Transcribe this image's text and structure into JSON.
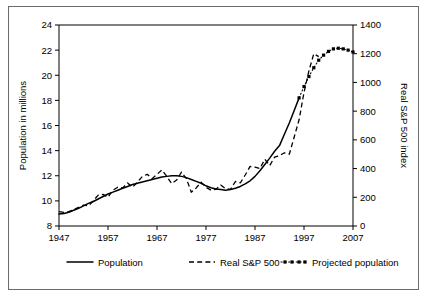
{
  "chart_data": {
    "type": "line",
    "title": "",
    "xlabel": "",
    "ylabel": "Population in millions",
    "y2label": "Real S&P 500 index",
    "xlim": [
      1947,
      2007
    ],
    "ylim": [
      8,
      24
    ],
    "y2lim": [
      0,
      1400
    ],
    "xticks": [
      1947,
      1957,
      1967,
      1977,
      1987,
      1997,
      2007
    ],
    "yticks": [
      8,
      10,
      12,
      14,
      16,
      18,
      20,
      22,
      24
    ],
    "y2ticks": [
      0,
      200,
      400,
      600,
      800,
      1000,
      1200,
      1400
    ],
    "grid": false,
    "legend_position": "bottom",
    "series": [
      {
        "name": "Population",
        "axis": "left",
        "style": "solid",
        "marker": "none",
        "x": [
          1947,
          1948,
          1949,
          1950,
          1951,
          1952,
          1953,
          1954,
          1955,
          1956,
          1957,
          1958,
          1959,
          1960,
          1961,
          1962,
          1963,
          1964,
          1965,
          1966,
          1967,
          1968,
          1969,
          1970,
          1971,
          1972,
          1973,
          1974,
          1975,
          1976,
          1977,
          1978,
          1979,
          1980,
          1981,
          1982,
          1983,
          1984,
          1985,
          1986,
          1987,
          1988,
          1989,
          1990,
          1991,
          1992,
          1993,
          1994,
          1995,
          1996
        ],
        "y": [
          8.95,
          9.0,
          9.1,
          9.25,
          9.4,
          9.6,
          9.8,
          9.95,
          10.15,
          10.35,
          10.55,
          10.7,
          10.85,
          11.0,
          11.15,
          11.3,
          11.4,
          11.5,
          11.6,
          11.7,
          11.8,
          11.9,
          11.95,
          12.0,
          12.0,
          11.95,
          11.85,
          11.7,
          11.55,
          11.4,
          11.2,
          11.05,
          10.95,
          10.9,
          10.85,
          10.9,
          11.0,
          11.15,
          11.35,
          11.6,
          11.95,
          12.4,
          12.9,
          13.4,
          13.95,
          14.4,
          15.3,
          16.2,
          17.2,
          18.2
        ]
      },
      {
        "name": "Real S&P 500",
        "axis": "right",
        "style": "dashed",
        "marker": "none",
        "x": [
          1947,
          1948,
          1949,
          1950,
          1951,
          1952,
          1953,
          1954,
          1955,
          1956,
          1957,
          1958,
          1959,
          1960,
          1961,
          1962,
          1963,
          1964,
          1965,
          1966,
          1967,
          1968,
          1969,
          1970,
          1971,
          1972,
          1973,
          1974,
          1975,
          1976,
          1977,
          1978,
          1979,
          1980,
          1981,
          1982,
          1983,
          1984,
          1985,
          1986,
          1987,
          1988,
          1989,
          1990,
          1991,
          1992,
          1993,
          1994,
          1995,
          1996,
          1997,
          1998,
          1999,
          2000
        ],
        "y": [
          100,
          95,
          100,
          115,
          130,
          145,
          140,
          175,
          215,
          220,
          200,
          250,
          270,
          265,
          300,
          270,
          305,
          345,
          360,
          330,
          360,
          390,
          345,
          295,
          320,
          375,
          330,
          235,
          265,
          305,
          270,
          250,
          255,
          285,
          260,
          255,
          310,
          300,
          355,
          415,
          410,
          400,
          465,
          420,
          480,
          490,
          510,
          500,
          620,
          740,
          930,
          1080,
          1200,
          1180
        ]
      },
      {
        "name": "Projected population",
        "axis": "left",
        "style": "dotted-marker",
        "marker": "square",
        "x": [
          1996,
          1997,
          1998,
          1999,
          2000,
          2001,
          2002,
          2003,
          2004,
          2005,
          2006,
          2007
        ],
        "y": [
          18.2,
          19.1,
          19.9,
          20.6,
          21.2,
          21.6,
          21.9,
          22.1,
          22.15,
          22.1,
          22.0,
          21.85
        ]
      }
    ],
    "legend": [
      {
        "label": "Population",
        "style": "solid"
      },
      {
        "label": "Real S&P 500",
        "style": "dashed"
      },
      {
        "label": "Projected population",
        "style": "dotted-marker"
      }
    ]
  }
}
